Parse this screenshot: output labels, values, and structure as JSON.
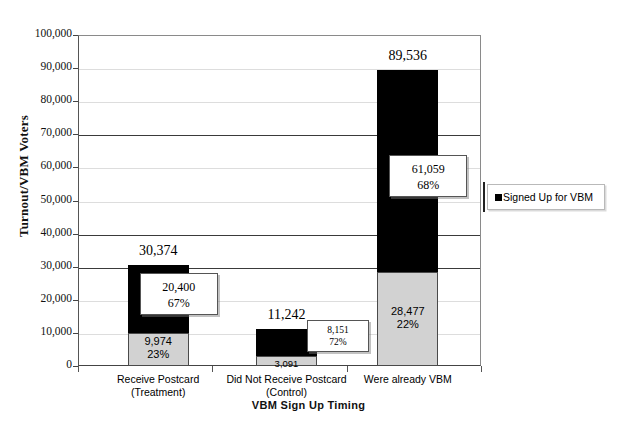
{
  "chart_data": {
    "type": "bar",
    "title": "",
    "xlabel": "VBM Sign Up Timing",
    "ylabel": "Turnout/VBM Voters",
    "ylim": [
      0,
      100000
    ],
    "ytick_step": 10000,
    "grid": true,
    "stacked": true,
    "legend_position": "right",
    "categories": [
      "Receive Postcard\n(Treatment)",
      "Did Not Receive Postcard\n(Control)",
      "Were already VBM"
    ],
    "category_lines": [
      [
        "Receive Postcard",
        "(Treatment)"
      ],
      [
        "Did Not Receive Postcard",
        "(Control)"
      ],
      [
        "Were already VBM",
        ""
      ]
    ],
    "ytick_labels": [
      "100,000",
      "90,000",
      "80,000",
      "70,000",
      "60,000",
      "50,000",
      "40,000",
      "30,000",
      "20,000",
      "10,000",
      "0"
    ],
    "ytick_values": [
      100000,
      90000,
      80000,
      70000,
      60000,
      50000,
      40000,
      30000,
      20000,
      10000,
      0
    ],
    "series": [
      {
        "name": "Turnout (base)",
        "style": "gray",
        "values": [
          9974,
          3091,
          28477
        ],
        "labels": [
          "9,974",
          "3,091",
          "28,477"
        ],
        "pct_labels": [
          "23%",
          "",
          "22%"
        ]
      },
      {
        "name": "Signed Up for VBM",
        "style": "black",
        "values": [
          20400,
          8151,
          61059
        ],
        "labels": [
          "20,400",
          "8,151",
          "61,059"
        ],
        "pct_labels": [
          "67%",
          "72%",
          "68%"
        ]
      }
    ],
    "totals": [
      30374,
      11242,
      89536
    ],
    "total_labels": [
      "30,374",
      "11,242",
      "89,536"
    ],
    "legend": [
      {
        "label": "Signed Up for VBM",
        "color": "#000000"
      }
    ],
    "colors": {
      "black_segment": "#000000",
      "gray_segment": "#d2d2d2",
      "gridline": "#dddddd",
      "gridline_major": "#3a3a3a",
      "axis": "#555555",
      "background": "#ffffff"
    }
  }
}
